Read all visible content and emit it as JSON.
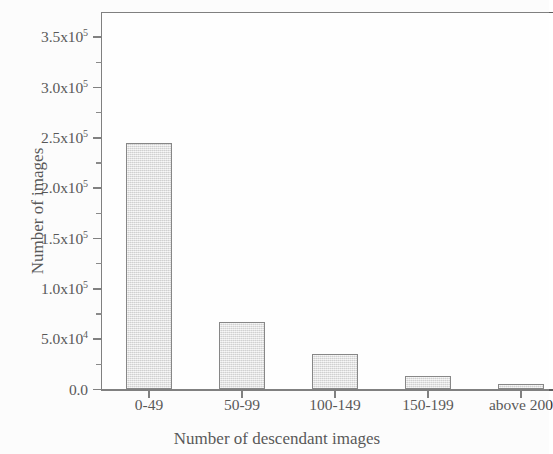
{
  "chart_data": {
    "type": "bar",
    "title": "",
    "xlabel": "Number of descendant images",
    "ylabel": "Number of images",
    "categories": [
      "0-49",
      "50-99",
      "100-149",
      "150-199",
      "above 200"
    ],
    "values": [
      245000,
      67500,
      35000,
      13000,
      5000
    ],
    "ylim": [
      0,
      375000
    ],
    "ytick_values": [
      0,
      50000,
      100000,
      150000,
      200000,
      250000,
      300000,
      350000
    ],
    "ytick_labels": [
      "0.0",
      "5.0x10",
      "1.0x10",
      "1.5x10",
      "2.0x10",
      "2.5x10",
      "3.0x10",
      "3.5x10"
    ],
    "ytick_exponents": [
      "",
      "4",
      "5",
      "5",
      "5",
      "5",
      "5",
      "5"
    ],
    "yminor_values": [
      25000,
      75000,
      125000,
      175000,
      225000,
      275000,
      325000
    ],
    "grid": false,
    "legend": null,
    "bar_fill_color": "#dedede",
    "bar_edge_color": "#676767",
    "axis_color": "#5e5e5e",
    "note": "right edge of plot is cropped in the screenshot"
  },
  "axes": {
    "y_title": "Number of images",
    "x_title": "Number of descendant images"
  }
}
